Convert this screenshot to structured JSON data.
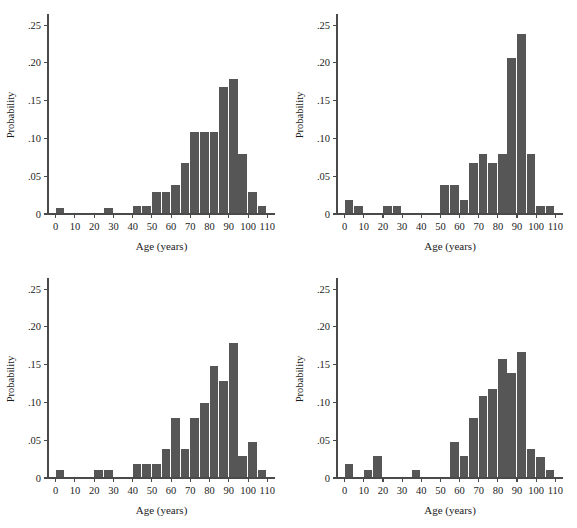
{
  "figure": {
    "background": "#ffffff",
    "bar_color": "#565656",
    "axis_color": "#4a4a4a",
    "panel_count": 4,
    "layout": "2x2 grid of histogram panels"
  },
  "chart_data": [
    {
      "type": "bar",
      "panel": "top-left",
      "title": "",
      "xlabel": "Age (years)",
      "ylabel": "Probability",
      "xlim": [
        -4,
        114
      ],
      "ylim": [
        0,
        0.262
      ],
      "grid": false,
      "legend": null,
      "bin_width": 5,
      "xticks": [
        0,
        10,
        20,
        30,
        40,
        50,
        60,
        70,
        80,
        90,
        100,
        110
      ],
      "xtick_labels": [
        "0",
        "10",
        "20",
        "30",
        "40",
        "50",
        "60",
        "70",
        "80",
        "90",
        "100",
        "110"
      ],
      "yticks": [
        0,
        0.05,
        0.1,
        0.15,
        0.2,
        0.25
      ],
      "ytick_labels": [
        "0",
        ".05",
        ".10",
        ".15",
        ".20",
        ".25"
      ],
      "bin_centers": [
        2.5,
        27.5,
        42.5,
        47.5,
        52.5,
        57.5,
        62.5,
        67.5,
        72.5,
        77.5,
        82.5,
        87.5,
        92.5,
        97.5,
        102.5,
        107.5
      ],
      "values": [
        0.008,
        0.008,
        0.01,
        0.01,
        0.029,
        0.029,
        0.038,
        0.068,
        0.108,
        0.108,
        0.108,
        0.168,
        0.178,
        0.079,
        0.029,
        0.01
      ]
    },
    {
      "type": "bar",
      "panel": "top-right",
      "title": "",
      "xlabel": "Age (years)",
      "ylabel": "Probability",
      "xlim": [
        -4,
        114
      ],
      "ylim": [
        0,
        0.262
      ],
      "grid": false,
      "legend": null,
      "bin_width": 5,
      "xticks": [
        0,
        10,
        20,
        30,
        40,
        50,
        60,
        70,
        80,
        90,
        100,
        110
      ],
      "xtick_labels": [
        "0",
        "10",
        "20",
        "30",
        "40",
        "50",
        "60",
        "70",
        "80",
        "90",
        "100",
        "110"
      ],
      "yticks": [
        0,
        0.05,
        0.1,
        0.15,
        0.2,
        0.25
      ],
      "ytick_labels": [
        "0",
        ".05",
        ".10",
        ".15",
        ".20",
        ".25"
      ],
      "bin_centers": [
        2.5,
        7.5,
        22.5,
        27.5,
        52.5,
        57.5,
        62.5,
        67.5,
        72.5,
        77.5,
        82.5,
        87.5,
        92.5,
        97.5,
        102.5,
        107.5
      ],
      "values": [
        0.019,
        0.01,
        0.01,
        0.01,
        0.038,
        0.038,
        0.019,
        0.068,
        0.079,
        0.068,
        0.079,
        0.207,
        0.238,
        0.079,
        0.01,
        0.01
      ]
    },
    {
      "type": "bar",
      "panel": "bottom-left",
      "title": "",
      "xlabel": "Age (years)",
      "ylabel": "Probability",
      "xlim": [
        -4,
        114
      ],
      "ylim": [
        0,
        0.262
      ],
      "grid": false,
      "legend": null,
      "bin_width": 5,
      "xticks": [
        0,
        10,
        20,
        30,
        40,
        50,
        60,
        70,
        80,
        90,
        100,
        110
      ],
      "xtick_labels": [
        "0",
        "10",
        "20",
        "30",
        "40",
        "50",
        "60",
        "70",
        "80",
        "90",
        "100",
        "110"
      ],
      "yticks": [
        0,
        0.05,
        0.1,
        0.15,
        0.2,
        0.25
      ],
      "ytick_labels": [
        "0",
        ".05",
        ".10",
        ".15",
        ".20",
        ".25"
      ],
      "bin_centers": [
        2.5,
        22.5,
        27.5,
        42.5,
        47.5,
        52.5,
        57.5,
        62.5,
        67.5,
        72.5,
        77.5,
        82.5,
        87.5,
        92.5,
        97.5,
        102.5,
        107.5
      ],
      "values": [
        0.01,
        0.01,
        0.01,
        0.019,
        0.019,
        0.019,
        0.038,
        0.079,
        0.038,
        0.079,
        0.099,
        0.148,
        0.128,
        0.178,
        0.029,
        0.048,
        0.01
      ]
    },
    {
      "type": "bar",
      "panel": "bottom-right",
      "title": "",
      "xlabel": "Age (years)",
      "ylabel": "Probability",
      "xlim": [
        -4,
        114
      ],
      "ylim": [
        0,
        0.262
      ],
      "grid": false,
      "legend": null,
      "bin_width": 5,
      "xticks": [
        0,
        10,
        20,
        30,
        40,
        50,
        60,
        70,
        80,
        90,
        100,
        110
      ],
      "xtick_labels": [
        "0",
        "10",
        "20",
        "30",
        "40",
        "50",
        "60",
        "70",
        "80",
        "90",
        "100",
        "110"
      ],
      "yticks": [
        0,
        0.05,
        0.1,
        0.15,
        0.2,
        0.25
      ],
      "ytick_labels": [
        "0",
        ".05",
        ".10",
        ".15",
        ".20",
        ".25"
      ],
      "bin_centers": [
        2.5,
        12.5,
        17.5,
        37.5,
        57.5,
        62.5,
        67.5,
        72.5,
        77.5,
        82.5,
        87.5,
        92.5,
        97.5,
        102.5,
        107.5
      ],
      "values": [
        0.019,
        0.01,
        0.029,
        0.01,
        0.048,
        0.029,
        0.079,
        0.108,
        0.118,
        0.158,
        0.139,
        0.167,
        0.038,
        0.028,
        0.01
      ]
    }
  ]
}
